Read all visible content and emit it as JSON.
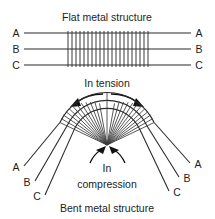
{
  "figure": {
    "title_top": "Flat metal structure",
    "title_bottom": "Bent metal structure",
    "annotations": {
      "tension": "In tension",
      "compression_line1": "In",
      "compression_line2": "compression"
    },
    "colors": {
      "background": "#ffffff",
      "line": "#2b2b2b",
      "hatch": "#3a3a3a",
      "arrow": "#111111",
      "text": "#1d1d1d"
    },
    "flat_structure": {
      "layers": [
        {
          "id": "A",
          "label_left": "A",
          "label_right": "A",
          "y": 33
        },
        {
          "id": "B",
          "label_left": "B",
          "label_right": "B",
          "y": 49
        },
        {
          "id": "C",
          "label_left": "C",
          "label_right": "C",
          "y": 65
        }
      ],
      "line_x_start": 24,
      "line_x_end": 191,
      "hatch_x_start": 68,
      "hatch_x_end": 148,
      "hatch_count": 21
    },
    "bent_structure": {
      "labels_left": [
        {
          "id": "A",
          "text": "A"
        },
        {
          "id": "B",
          "text": "B"
        },
        {
          "id": "C",
          "text": "C"
        }
      ],
      "labels_right": [
        {
          "id": "A",
          "text": "A"
        },
        {
          "id": "B",
          "text": "B"
        },
        {
          "id": "C",
          "text": "C"
        }
      ],
      "apex_x": 107,
      "apex_y": 145,
      "fan_count": 23,
      "arc_radii": [
        52,
        44,
        36
      ],
      "arc_span_degrees": 130
    }
  }
}
